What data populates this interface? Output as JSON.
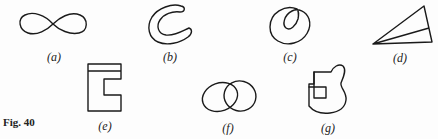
{
  "figure": {
    "caption": "Fig. 40",
    "stroke_color": "#1a1a1a",
    "panels": [
      {
        "id": "a",
        "label": "(a)",
        "shape": "figure-eight / infinity loop"
      },
      {
        "id": "b",
        "label": "(b)",
        "shape": "thick C-shaped band"
      },
      {
        "id": "c",
        "label": "(c)",
        "shape": "self-intersecting loop with inner loop"
      },
      {
        "id": "d",
        "label": "(d)",
        "shape": "triangle with interior line from apex"
      },
      {
        "id": "e",
        "label": "(e)",
        "shape": "E-like rectangle with notch and top band"
      },
      {
        "id": "f",
        "label": "(f)",
        "shape": "two overlapping ovals"
      },
      {
        "id": "g",
        "label": "(g)",
        "shape": "irregular blob with intersecting square"
      }
    ]
  }
}
